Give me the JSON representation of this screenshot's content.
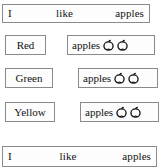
{
  "page": {
    "background_color": "#ffffff",
    "border_color": "#8a8a8a",
    "text_color": "#111111"
  },
  "rows": [
    {
      "type": "sentence",
      "words": [
        "I",
        "like",
        "apples"
      ]
    },
    {
      "type": "pair",
      "label": "Red",
      "phrase": "apples",
      "apple_count": 2,
      "icon": "apple-icon"
    },
    {
      "type": "pair",
      "label": "Green",
      "phrase": "apples",
      "apple_count": 2,
      "icon": "apple-icon"
    },
    {
      "type": "pair",
      "label": "Yellow",
      "phrase": "apples",
      "apple_count": 2,
      "icon": "apple-icon"
    },
    {
      "type": "sentence",
      "words": [
        "I",
        "like",
        "apples"
      ]
    }
  ],
  "sentence_top": {
    "word1": "I",
    "word2": "like",
    "word3": "apples"
  },
  "row_red": {
    "label": "Red",
    "phrase": "apples"
  },
  "row_green": {
    "label": "Green",
    "phrase": "apples"
  },
  "row_yellow": {
    "label": "Yellow",
    "phrase": "apples"
  },
  "sentence_bottom": {
    "word1": "I",
    "word2": "like",
    "word3": "apples"
  }
}
